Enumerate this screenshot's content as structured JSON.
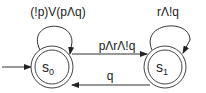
{
  "diagram": {
    "type": "finite-state-automaton",
    "states": [
      {
        "id": "s0",
        "label": "s",
        "subscript": "0",
        "initial": true,
        "accepting": true,
        "cx": 52,
        "cy": 67
      },
      {
        "id": "s1",
        "label": "s",
        "subscript": "1",
        "initial": false,
        "accepting": true,
        "cx": 165,
        "cy": 67
      }
    ],
    "transitions": [
      {
        "from": "s0",
        "to": "s0",
        "label": "(!p)V(pΛq)"
      },
      {
        "from": "s0",
        "to": "s1",
        "label": "pΛrΛ!q"
      },
      {
        "from": "s1",
        "to": "s1",
        "label": "rΛ!q"
      },
      {
        "from": "s1",
        "to": "s0",
        "label": "q"
      }
    ],
    "colors": {
      "stroke": "#333333",
      "text": "#222222",
      "background": "#ffffff"
    }
  }
}
